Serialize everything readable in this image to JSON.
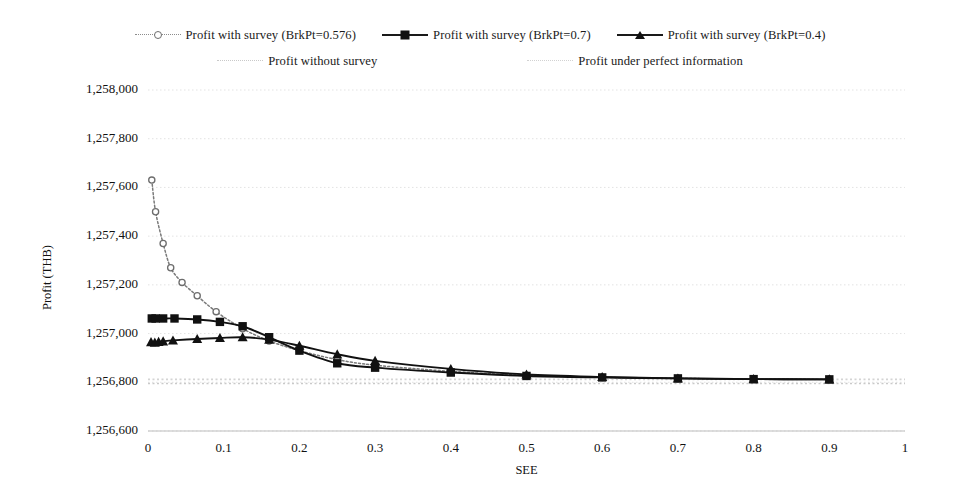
{
  "chart_data": {
    "type": "line",
    "title": "",
    "xlabel": "SEE",
    "ylabel": "Profit (THB)",
    "xlim": [
      0,
      1
    ],
    "ylim": [
      1256600,
      1258000
    ],
    "xticks": [
      "0",
      "0.1",
      "0.2",
      "0.3",
      "0.4",
      "0.5",
      "0.6",
      "0.7",
      "0.8",
      "0.9",
      "1"
    ],
    "xtick_values": [
      0,
      0.1,
      0.2,
      0.3,
      0.4,
      0.5,
      0.6,
      0.7,
      0.8,
      0.9,
      1
    ],
    "yticks": [
      "1,256,600",
      "1,256,800",
      "1,257,000",
      "1,257,200",
      "1,257,400",
      "1,257,600",
      "1,257,800",
      "1,258,000"
    ],
    "ytick_values": [
      1256600,
      1256800,
      1257000,
      1257200,
      1257400,
      1257600,
      1257800,
      1258000
    ],
    "grid": true,
    "grid_axis": "y",
    "legend_position": "top",
    "series": [
      {
        "name": "Profit with survey (BrkPt=0.576)",
        "style": "dotted",
        "marker": "circle",
        "color": "#7a7a7a",
        "x": [
          0.005,
          0.01,
          0.02,
          0.03,
          0.045,
          0.065,
          0.09,
          0.125,
          0.16,
          0.2,
          0.25,
          0.3,
          0.4,
          0.5,
          0.6,
          0.7,
          0.8,
          0.9
        ],
        "y": [
          1257630,
          1257500,
          1257370,
          1257270,
          1257210,
          1257155,
          1257090,
          1257020,
          1256970,
          1256930,
          1256893,
          1256870,
          1256845,
          1256828,
          1256820,
          1256816,
          1256813,
          1256812
        ]
      },
      {
        "name": "Profit with survey (BrkPt=0.7)",
        "style": "solid",
        "marker": "square",
        "color": "#111111",
        "x": [
          0.005,
          0.01,
          0.02,
          0.035,
          0.065,
          0.095,
          0.125,
          0.16,
          0.2,
          0.25,
          0.3,
          0.4,
          0.5,
          0.6,
          0.7,
          0.8,
          0.9
        ],
        "y": [
          1257062,
          1257062,
          1257062,
          1257062,
          1257058,
          1257048,
          1257030,
          1256985,
          1256930,
          1256878,
          1256860,
          1256840,
          1256826,
          1256820,
          1256816,
          1256813,
          1256812
        ]
      },
      {
        "name": "Profit with survey (BrkPt=0.4)",
        "style": "solid",
        "marker": "triangle",
        "color": "#111111",
        "x": [
          0.004,
          0.009,
          0.014,
          0.02,
          0.033,
          0.065,
          0.095,
          0.125,
          0.16,
          0.2,
          0.25,
          0.3,
          0.4,
          0.5,
          0.6,
          0.7,
          0.8,
          0.9
        ],
        "y": [
          1256965,
          1256963,
          1256966,
          1256968,
          1256972,
          1256978,
          1256982,
          1256985,
          1256975,
          1256950,
          1256915,
          1256888,
          1256855,
          1256832,
          1256822,
          1256816,
          1256813,
          1256812
        ]
      }
    ],
    "reference_lines": [
      {
        "name": "Profit without survey",
        "style": "dotted",
        "color": "#c9c9c9",
        "y": 1256795
      },
      {
        "name": "Profit under perfect information",
        "style": "dotted",
        "color": "#d4d4d4",
        "y": 1256812
      }
    ]
  },
  "legend": {
    "rows": [
      [
        {
          "label": "Profit with survey (BrkPt=0.576)",
          "marker": "circle-marker",
          "line": "dotted"
        },
        {
          "label": "Profit with survey (BrkPt=0.7)",
          "marker": "square-marker",
          "line": "solid"
        },
        {
          "label": "Profit with survey (BrkPt=0.4)",
          "marker": "triangle-marker",
          "line": "solid"
        }
      ],
      [
        {
          "label": "Profit without survey",
          "marker": "none",
          "line": "faint-dotted"
        },
        {
          "label": "Profit under perfect information",
          "marker": "none",
          "line": "faint-dotted"
        }
      ]
    ]
  }
}
